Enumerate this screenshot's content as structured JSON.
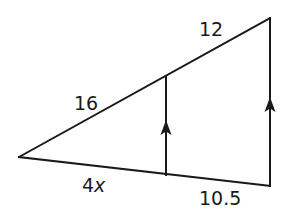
{
  "figure": {
    "type": "geometry-triangle-proportion",
    "colors": {
      "stroke": "#1a1a1a",
      "background": "#ffffff"
    },
    "vertices": {
      "left_apex": [
        19,
        157
      ],
      "top_right": [
        270,
        18
      ],
      "bottom_right": [
        270,
        186
      ],
      "mid_top": [
        166,
        77
      ],
      "mid_bottom": [
        166,
        175
      ]
    },
    "labels": {
      "upper_left_segment": "16",
      "upper_right_segment": "12",
      "lower_left_segment": "4",
      "lower_left_variable": "x",
      "lower_right_segment": "10.5"
    },
    "parallel_marks": {
      "count": 2,
      "symbol": "arrow-up",
      "on": [
        "middle-vertical-segment",
        "right-vertical-side"
      ]
    }
  }
}
